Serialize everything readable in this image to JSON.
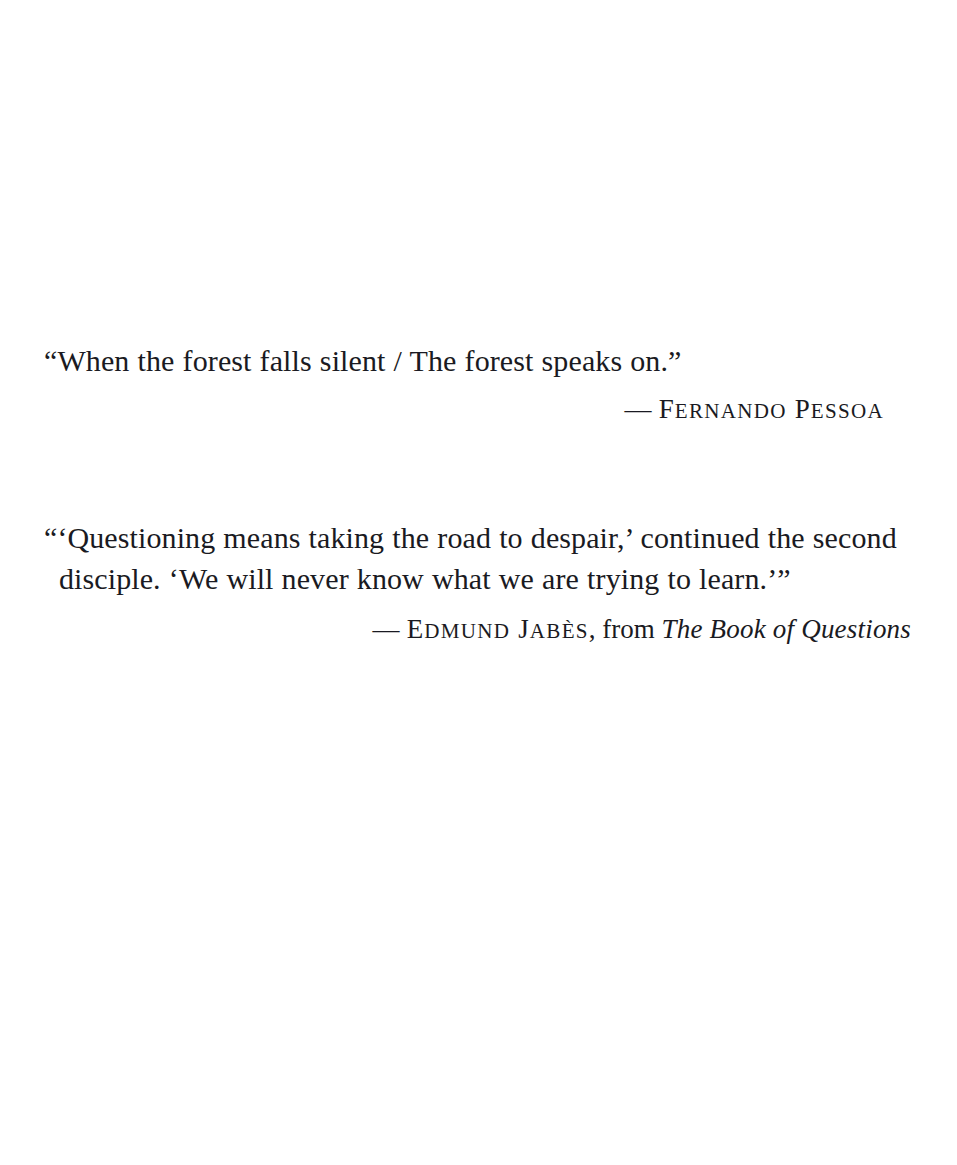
{
  "page": {
    "background_color": "#ffffff",
    "ink_color": "#1a1a22",
    "width": 957,
    "height": 1165
  },
  "epigraphs": [
    {
      "id": "pessoa",
      "quote": "“When the forest falls silent / The forest speaks on.”",
      "attribution": {
        "dash": "—",
        "author_initial": "F",
        "author_rest_1": "ERNANDO",
        "space": " ",
        "author_initial_2": "P",
        "author_rest_2": "ESSOA"
      }
    },
    {
      "id": "jabes",
      "quote_line_1": "“‘Questioning means taking the road to despair,’ continued the second",
      "quote_line_2": "disciple. ‘We will never know what we are trying to learn.’”",
      "attribution": {
        "dash": "—",
        "author_initial": "E",
        "author_rest_1": "DMUND",
        "space": " ",
        "author_initial_2": "J",
        "author_rest_2": "ABÈS",
        "comma": ",",
        "from_word": "from",
        "book_title": "The Book of Questions"
      }
    }
  ]
}
